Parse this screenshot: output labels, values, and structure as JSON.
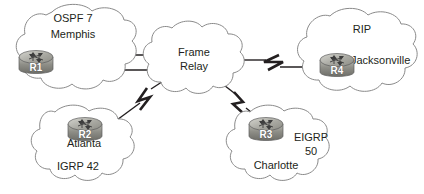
{
  "diagram": {
    "colors": {
      "line": "#231f20",
      "cloud_stroke": "#8a8a8a",
      "cloud_fill": "#ffffff",
      "router_body": "#9a9a93",
      "text": "#231f20"
    },
    "clouds": [
      {
        "id": "memphis",
        "name": "OSPF 7 Memphis cloud",
        "labels": [
          "OSPF 7",
          "Memphis"
        ],
        "router": {
          "id": "r1",
          "name": "R1",
          "site": "Memphis",
          "protocol": "OSPF 7"
        }
      },
      {
        "id": "frame-relay",
        "name": "Frame Relay cloud",
        "labels": [
          "Frame",
          "Relay"
        ],
        "router": null
      },
      {
        "id": "jacksonville",
        "name": "RIP Jacksonville cloud",
        "labels": [
          "RIP",
          "Jacksonville"
        ],
        "router": {
          "id": "r4",
          "name": "R4",
          "site": "Jacksonville",
          "protocol": "RIP"
        }
      },
      {
        "id": "atlanta",
        "name": "IGRP 42 Atlanta cloud",
        "labels": [
          "Atlanta",
          "IGRP 42"
        ],
        "router": {
          "id": "r2",
          "name": "R2",
          "site": "Atlanta",
          "protocol": "IGRP 42"
        }
      },
      {
        "id": "charlotte",
        "name": "EIGRP 50 Charlotte cloud",
        "labels": [
          "EIGRP",
          "50",
          "Charlotte"
        ],
        "router": {
          "id": "r3",
          "name": "R3",
          "site": "Charlotte",
          "protocol": "EIGRP 50"
        }
      }
    ],
    "labels": {
      "memphis_protocol": "OSPF 7",
      "memphis_site": "Memphis",
      "frame_line1": "Frame",
      "frame_line2": "Relay",
      "rip_protocol": "RIP",
      "jacksonville_site": "Jacksonville",
      "atlanta_site": "Atlanta",
      "atlanta_protocol": "IGRP 42",
      "eigrp_protocol": "EIGRP",
      "eigrp_asn": "50",
      "charlotte_site": "Charlotte",
      "r1": "R1",
      "r2": "R2",
      "r3": "R3",
      "r4": "R4"
    },
    "links": [
      {
        "id": "r1-fr-upper",
        "from": "R1",
        "to": "Frame Relay",
        "type": "serial",
        "serial_marker": true
      },
      {
        "id": "r1-fr-lower",
        "from": "R1",
        "to": "Frame Relay",
        "type": "serial",
        "serial_marker": true
      },
      {
        "id": "fr-r4",
        "from": "Frame Relay",
        "to": "R4",
        "type": "serial",
        "serial_marker": true
      },
      {
        "id": "r2-fr",
        "from": "R2",
        "to": "Frame Relay",
        "type": "serial",
        "serial_marker": true
      },
      {
        "id": "fr-r3",
        "from": "Frame Relay",
        "to": "R3",
        "type": "serial",
        "serial_marker": true
      }
    ]
  }
}
